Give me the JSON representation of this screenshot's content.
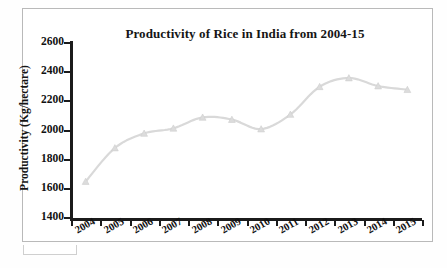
{
  "chart_data": {
    "type": "line",
    "title": "Productivity of Rice in India from 2004-15",
    "xlabel": "",
    "ylabel": "Productivity (Kg/hectare)",
    "categories": [
      "2004",
      "2005",
      "2006",
      "2007",
      "2008",
      "2009",
      "2010",
      "2011",
      "2012",
      "2013",
      "2014",
      "2015"
    ],
    "values": [
      1650,
      1880,
      1980,
      2015,
      2090,
      2075,
      2010,
      2110,
      2300,
      2360,
      2305,
      2280
    ],
    "series": [
      {
        "name": "Productivity of Rice",
        "values": [
          1650,
          1880,
          1980,
          2015,
          2090,
          2075,
          2010,
          2110,
          2300,
          2360,
          2305,
          2280
        ]
      }
    ],
    "ylim": [
      1400,
      2600
    ],
    "ytick_values": [
      2600,
      2400,
      2200,
      2000,
      1800,
      1600,
      1400
    ],
    "ytick_labels": [
      "2600",
      "2400",
      "2200",
      "2000",
      "1800",
      "1600",
      "1400"
    ],
    "grid": false,
    "legend": false,
    "legend_position": "none",
    "marker": "triangle",
    "line_color": "#d9d9d9",
    "marker_color": "#dcdcdc",
    "axis_color": "#1b1b1b"
  }
}
